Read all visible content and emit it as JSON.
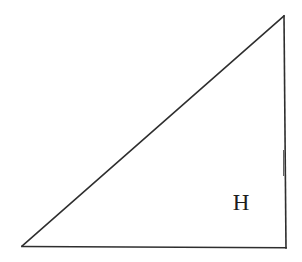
{
  "figure": {
    "kind": "right-triangle-diagram",
    "background_color": "#ffffff",
    "stroke_color": "#2e2e2e",
    "label_color": "#1d1d1d",
    "labels": {
      "height_label": "H"
    },
    "geometry": {
      "apex": {
        "x": 284,
        "y": 16
      },
      "bottom_left": {
        "x": 22,
        "y": 246
      },
      "bottom_right": {
        "x": 286,
        "y": 248
      },
      "label_position": {
        "x": 241,
        "y": 210
      }
    }
  }
}
